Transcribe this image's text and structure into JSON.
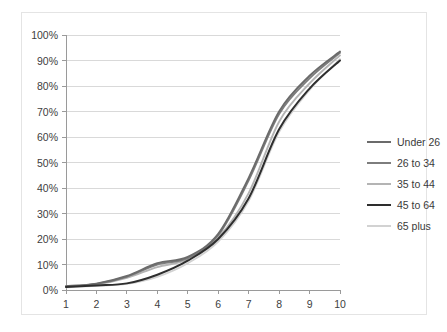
{
  "chart_data": {
    "type": "line",
    "title": "",
    "subtitle": "",
    "xlabel": "",
    "ylabel": "",
    "xlim": [
      1,
      10
    ],
    "ylim": [
      0,
      100
    ],
    "grid": true,
    "grid_axis": "y",
    "legend_position": "right",
    "x": [
      1,
      2,
      3,
      4,
      5,
      6,
      7,
      8,
      9,
      10
    ],
    "xticklabels": [
      "1",
      "2",
      "3",
      "4",
      "5",
      "6",
      "7",
      "8",
      "9",
      "10"
    ],
    "yticks": [
      0,
      10,
      20,
      30,
      40,
      50,
      60,
      70,
      80,
      90,
      100
    ],
    "yticklabels": [
      "0%",
      "10%",
      "20%",
      "30%",
      "40%",
      "50%",
      "60%",
      "70%",
      "80%",
      "90%",
      "100%"
    ],
    "series": [
      {
        "name": "Under 26",
        "color": "#6b6b6b",
        "width": 1.9,
        "values": [
          1.5,
          2.5,
          5.5,
          10.5,
          13.0,
          22.0,
          44.0,
          70.0,
          84.0,
          93.5
        ]
      },
      {
        "name": "26 to 34",
        "color": "#7d7d7d",
        "width": 1.9,
        "values": [
          1.4,
          2.4,
          5.2,
          10.0,
          12.5,
          21.5,
          43.0,
          69.0,
          83.0,
          93.0
        ]
      },
      {
        "name": "35 to 44",
        "color": "#b4b4b4",
        "width": 1.9,
        "values": [
          1.3,
          2.2,
          4.8,
          9.0,
          12.0,
          20.5,
          38.0,
          66.0,
          81.0,
          92.0
        ]
      },
      {
        "name": "45 to 64",
        "color": "#2e2e2e",
        "width": 2.0,
        "values": [
          1.2,
          1.8,
          2.6,
          6.0,
          11.5,
          20.0,
          36.0,
          63.0,
          79.0,
          90.0
        ]
      },
      {
        "name": "65 plus",
        "color": "#d2d2d2",
        "width": 1.9,
        "values": [
          1.1,
          1.6,
          2.4,
          5.2,
          10.5,
          19.0,
          35.0,
          62.0,
          78.5,
          90.5
        ]
      }
    ]
  },
  "legend": {
    "items": [
      {
        "label": "Under 26"
      },
      {
        "label": "26 to 34"
      },
      {
        "label": "35 to 44"
      },
      {
        "label": "45 to 64"
      },
      {
        "label": "65 plus"
      }
    ]
  },
  "colors": {
    "plot_border": "#9a9a9a",
    "gridline": "#d9d9d9",
    "frame_border": "#e4e4e4",
    "background": "#ffffff",
    "tick_text": "#404040"
  }
}
